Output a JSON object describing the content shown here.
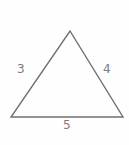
{
  "figure": {
    "kind": "triangle-diagram",
    "background_color": "#fefefe",
    "stroke_color": "#6f6f6f",
    "label_color": "#7c7c7c",
    "stroke_width": 1.4,
    "vertices": {
      "apex": [
        70,
        31
      ],
      "bottom_left": [
        11,
        117
      ],
      "bottom_right": [
        123,
        117
      ]
    },
    "labels": {
      "left_side": "3",
      "right_side": "4",
      "bottom_side": "5"
    }
  }
}
